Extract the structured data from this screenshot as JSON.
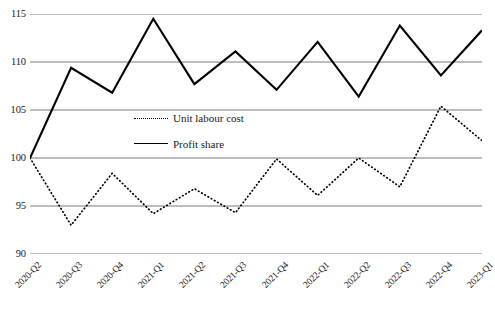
{
  "chart_data": {
    "type": "line",
    "title": "",
    "xlabel": "",
    "ylabel": "",
    "ylim": [
      90,
      115
    ],
    "yticks": [
      90,
      95,
      100,
      105,
      110,
      115
    ],
    "grid": true,
    "legend_position": "center-left-inside",
    "categories": [
      "2020-Q2",
      "2020-Q3",
      "2020-Q4",
      "2021-Q1",
      "2021-Q2",
      "2021-Q3",
      "2021-Q4",
      "2022-Q1",
      "2022-Q2",
      "2022-Q3",
      "2022-Q4",
      "2023-Q1"
    ],
    "series": [
      {
        "name": "Unit labour cost",
        "style": "dotted",
        "color": "#000000",
        "values": [
          100.0,
          93.0,
          98.4,
          94.2,
          96.8,
          94.3,
          99.9,
          96.1,
          100.0,
          97.0,
          105.4,
          101.8
        ]
      },
      {
        "name": "Profit share",
        "style": "solid",
        "color": "#000000",
        "values": [
          100.0,
          109.4,
          106.8,
          114.5,
          107.7,
          111.1,
          107.1,
          112.1,
          106.4,
          113.8,
          108.6,
          113.3
        ]
      }
    ]
  },
  "axes": {
    "y_tick_labels": [
      "115",
      "110",
      "105",
      "100",
      "95",
      "90"
    ],
    "x_tick_labels": [
      "2020-Q2",
      "2020-Q3",
      "2020-Q4",
      "2021-Q1",
      "2021-Q2",
      "2021-Q3",
      "2021-Q4",
      "2022-Q1",
      "2022-Q2",
      "2022-Q3",
      "2022-Q4",
      "2023-Q1"
    ]
  },
  "legend": {
    "items": [
      {
        "label": "Unit labour cost",
        "style": "dotted"
      },
      {
        "label": "Profit share",
        "style": "solid"
      }
    ]
  },
  "colors": {
    "gridline": "#a6a6a6",
    "series_line": "#000000",
    "background": "#ffffff",
    "text": "#1a1a1a"
  }
}
